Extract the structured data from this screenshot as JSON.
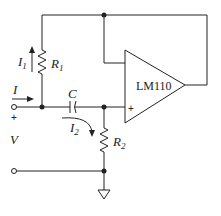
{
  "diagram": {
    "type": "circuit-schematic",
    "opamp": {
      "label": "LM110",
      "plus_label": "+"
    },
    "components": {
      "R1": {
        "label": "R",
        "sub": "1"
      },
      "R2": {
        "label": "R",
        "sub": "2"
      },
      "C": {
        "label": "C"
      }
    },
    "currents": {
      "I": {
        "label": "I"
      },
      "I1": {
        "label": "I",
        "sub": "1"
      },
      "I2": {
        "label": "I",
        "sub": "2"
      }
    },
    "voltage": {
      "label": "V",
      "plus_label": "+"
    },
    "ground": {
      "label": "ground"
    }
  }
}
